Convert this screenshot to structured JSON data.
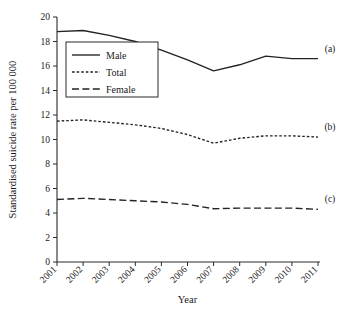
{
  "chart_data": {
    "type": "line",
    "title": "",
    "xlabel": "Year",
    "ylabel": "Standardised suicide rate per 100 000",
    "categories": [
      "2001",
      "2002",
      "2003",
      "2004",
      "2005",
      "2006",
      "2007",
      "2008",
      "2009",
      "2010",
      "2011"
    ],
    "x": [
      2001,
      2002,
      2003,
      2004,
      2005,
      2006,
      2007,
      2008,
      2009,
      2010,
      2011
    ],
    "xlim": [
      2001,
      2011
    ],
    "ylim": [
      0,
      20
    ],
    "yticks": [
      0,
      2,
      4,
      6,
      8,
      10,
      12,
      14,
      16,
      18,
      20
    ],
    "ytick_labels": [
      "0",
      "2",
      "4",
      "6",
      "8",
      "10",
      "12",
      "14",
      "16",
      "18",
      "20"
    ],
    "grid": false,
    "legend_position": "upper-left-inside",
    "series": [
      {
        "name": "Male",
        "style": "solid",
        "annotation": "(a)",
        "values": [
          18.8,
          18.9,
          18.5,
          18.0,
          17.3,
          16.5,
          15.6,
          16.1,
          16.8,
          16.6,
          16.6
        ]
      },
      {
        "name": "Total",
        "style": "dotted",
        "annotation": "(b)",
        "values": [
          11.5,
          11.6,
          11.4,
          11.2,
          10.9,
          10.4,
          9.7,
          10.1,
          10.3,
          10.3,
          10.2
        ]
      },
      {
        "name": "Female",
        "style": "dashed",
        "annotation": "(c)",
        "values": [
          5.1,
          5.2,
          5.1,
          5.0,
          4.9,
          4.7,
          4.35,
          4.4,
          4.4,
          4.4,
          4.3
        ]
      }
    ],
    "annotations": [
      {
        "label": "(a)",
        "series": "Male"
      },
      {
        "label": "(b)",
        "series": "Total"
      },
      {
        "label": "(c)",
        "series": "Female"
      }
    ]
  },
  "legend": {
    "items": [
      {
        "label": "Male"
      },
      {
        "label": "Total"
      },
      {
        "label": "Female"
      }
    ]
  },
  "caption": {
    "text": ""
  }
}
